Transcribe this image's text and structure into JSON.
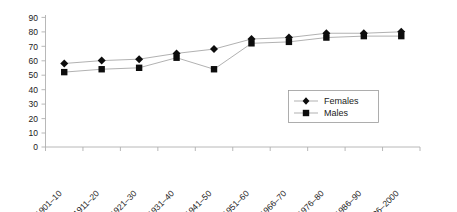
{
  "chart_data": {
    "type": "line",
    "title": "",
    "subtitle": "",
    "xlabel": "",
    "ylabel": "",
    "categories": [
      "1901–10",
      "1911–20",
      "1921–30",
      "1931–40",
      "1941–50",
      "1951–60",
      "1966–70",
      "1976–80",
      "1986–90",
      "1996–2000"
    ],
    "series": [
      {
        "name": "Females",
        "marker": "diamond",
        "values": [
          58,
          60,
          61,
          65,
          68,
          75,
          76,
          79,
          79,
          80
        ]
      },
      {
        "name": "Males",
        "marker": "square",
        "values": [
          52,
          54,
          55,
          62,
          54,
          72,
          73,
          76,
          77,
          77
        ]
      }
    ],
    "ylim": [
      0,
      90
    ],
    "yticks": [
      0,
      10,
      20,
      30,
      40,
      50,
      60,
      70,
      80,
      90
    ],
    "grid": false,
    "legend_position": "center-right-inside"
  },
  "axis": {
    "y_tick_labels": [
      "90",
      "80",
      "70",
      "60",
      "50",
      "40",
      "30",
      "20",
      "10",
      "0"
    ],
    "x_tick_labels": [
      "1901–10",
      "1911–20",
      "1921–30",
      "1931–40",
      "1941–50",
      "1951–60",
      "1966–70",
      "1976–80",
      "1986–90",
      "1996–2000"
    ]
  },
  "legend": {
    "entries": [
      {
        "label": "Females",
        "marker_name": "diamond-marker-icon"
      },
      {
        "label": "Males",
        "marker_name": "square-marker-icon"
      }
    ]
  },
  "colors": {
    "series_line": "#a8a8a8",
    "marker": "#0d0d0d",
    "axis": "#b0b0b0",
    "text": "#1a1a1a",
    "background": "#ffffff"
  }
}
